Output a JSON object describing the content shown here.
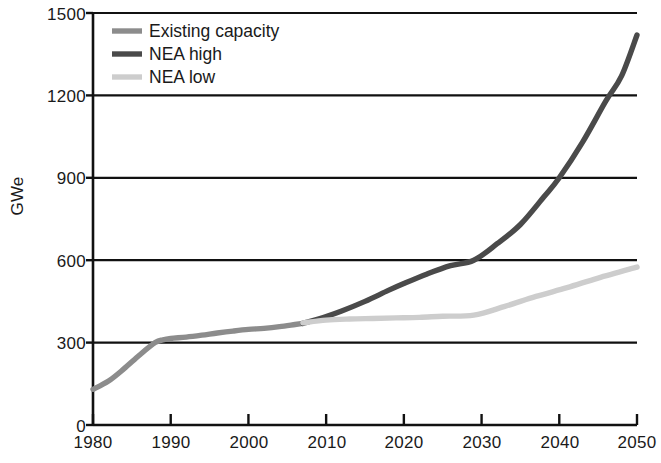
{
  "chart_data": {
    "type": "line",
    "title": "",
    "xlabel": "",
    "ylabel": "GWe",
    "xlim": [
      1980,
      2050
    ],
    "ylim": [
      0,
      1500
    ],
    "grid": true,
    "legend_position": "top-left",
    "x_ticks": [
      "1980",
      "1990",
      "2000",
      "2010",
      "2020",
      "2030",
      "2040",
      "2050"
    ],
    "y_ticks": [
      "0",
      "300",
      "600",
      "900",
      "1200",
      "1500"
    ],
    "origin_label": "0",
    "series": [
      {
        "name": "Existing capacity",
        "color": "#8c8c8c",
        "x": [
          1980,
          1982,
          1984,
          1986,
          1988,
          1989,
          1990,
          1992,
          1994,
          1996,
          1998,
          2000,
          2002,
          2004,
          2006,
          2007
        ],
        "values": [
          130,
          160,
          205,
          255,
          300,
          310,
          315,
          320,
          327,
          335,
          342,
          348,
          352,
          358,
          366,
          370
        ]
      },
      {
        "name": "NEA high",
        "color": "#4a4a4a",
        "x": [
          2007,
          2010,
          2012,
          2015,
          2018,
          2020,
          2023,
          2026,
          2029,
          2032,
          2035,
          2038,
          2040,
          2043,
          2046,
          2048,
          2050
        ],
        "values": [
          370,
          395,
          415,
          450,
          490,
          515,
          550,
          580,
          600,
          660,
          730,
          830,
          900,
          1030,
          1180,
          1270,
          1420
        ]
      },
      {
        "name": "NEA low",
        "color": "#cdcdcd",
        "x": [
          2007,
          2010,
          2013,
          2016,
          2019,
          2022,
          2025,
          2029,
          2033,
          2037,
          2041,
          2045,
          2050
        ],
        "values": [
          372,
          382,
          386,
          388,
          390,
          392,
          396,
          400,
          432,
          468,
          500,
          535,
          575
        ]
      }
    ]
  },
  "legend": {
    "items": [
      {
        "label": "Existing capacity",
        "color": "#8c8c8c"
      },
      {
        "label": "NEA high",
        "color": "#4a4a4a"
      },
      {
        "label": "NEA low",
        "color": "#cdcdcd"
      }
    ]
  },
  "axis": {
    "color": "#111111"
  }
}
